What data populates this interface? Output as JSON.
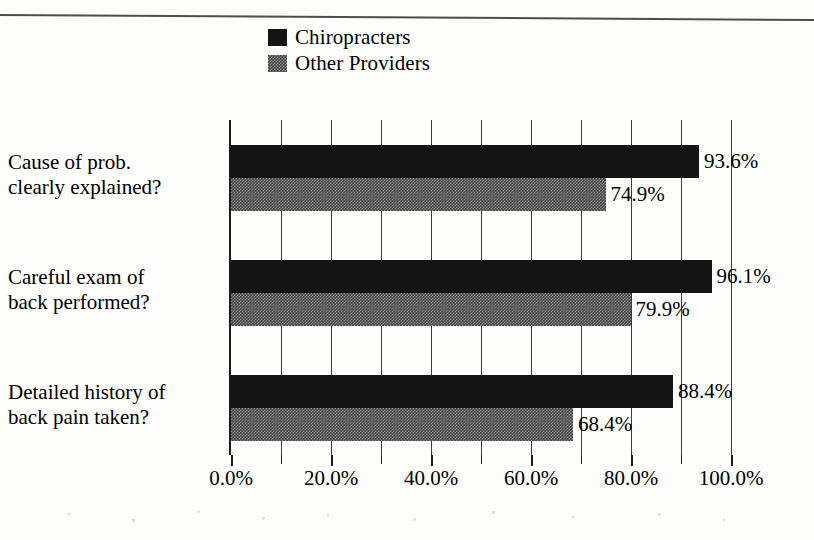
{
  "chart_data": {
    "type": "bar",
    "orientation": "horizontal",
    "title": "",
    "xlabel": "",
    "ylabel": "",
    "categories": [
      "Cause of prob. clearly explained?",
      "Careful exam of back performed?",
      "Detailed history of back pain taken?"
    ],
    "category_lines": [
      [
        "Cause of prob.",
        "clearly explained?"
      ],
      [
        "Careful exam of",
        "back performed?"
      ],
      [
        "Detailed history of",
        "back pain taken?"
      ]
    ],
    "series": [
      {
        "name": "Chiropracters",
        "values": [
          93.6,
          96.1,
          88.4
        ],
        "value_labels": [
          "93.6%",
          "96.1%",
          "88.4%"
        ],
        "fill": "solid-black",
        "color": "#141414"
      },
      {
        "name": "Other Providers",
        "values": [
          74.9,
          79.9,
          68.4
        ],
        "value_labels": [
          "74.9%",
          "79.9%",
          "68.4%"
        ],
        "fill": "hatched-gray",
        "color": "#4a4a4a"
      }
    ],
    "xlim": [
      0,
      100
    ],
    "xticks": [
      0,
      20,
      40,
      60,
      80,
      100
    ],
    "xtick_labels": [
      "0.0%",
      "20.0%",
      "40.0%",
      "60.0%",
      "80.0%",
      "100.0%"
    ],
    "minor_tick_interval": 10,
    "grid": "vertical-only",
    "legend_position": "top-center"
  },
  "legend": {
    "items": [
      {
        "label": "Chiropracters",
        "swatch": "solid-black-swatch"
      },
      {
        "label": "Other Providers",
        "swatch": "hatched-gray-swatch"
      }
    ]
  }
}
